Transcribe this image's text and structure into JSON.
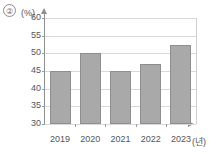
{
  "marker": {
    "label": "②"
  },
  "chart_data": {
    "type": "bar",
    "title": "",
    "subtitle": "",
    "xlabel": "(년)",
    "ylabel": "(%)",
    "categories": [
      "2019",
      "2020",
      "2021",
      "2022",
      "2023"
    ],
    "values": [
      45,
      50,
      45,
      47,
      52.5
    ],
    "series": [
      {
        "name": "",
        "values": [
          45,
          50,
          45,
          47,
          52.5
        ]
      }
    ],
    "ylim": [
      30,
      60
    ],
    "yticks": [
      30,
      35,
      40,
      45,
      50,
      55,
      60
    ],
    "ytick_labels": [
      "30",
      "35",
      "40",
      "45",
      "50",
      "55",
      "60"
    ],
    "grid": true,
    "legend": false,
    "legend_position": "none",
    "bar_color": "#a9a9a9",
    "bar_border_color": "#8e8e8e",
    "gridline_color": "#d9d9d9",
    "axis_color": "#8f8f8f",
    "background_color": "#ffffff"
  }
}
